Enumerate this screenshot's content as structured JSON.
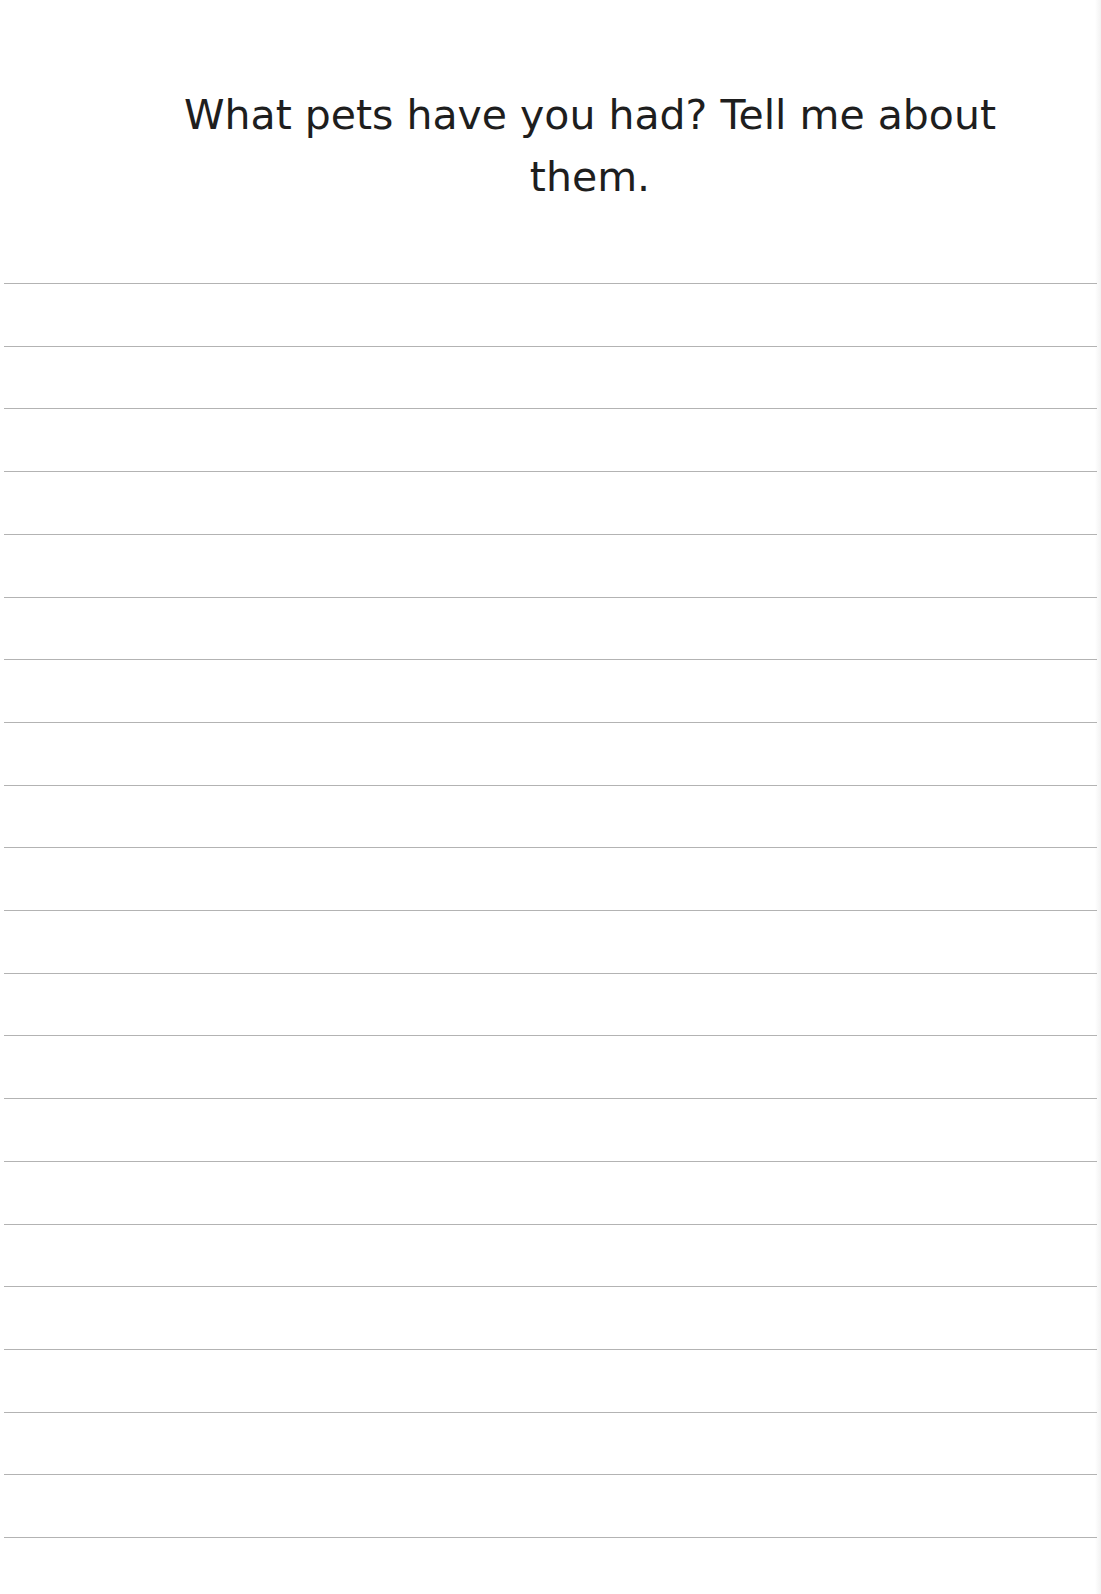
{
  "prompt": {
    "text": "What pets have you had? Tell me about them."
  },
  "writing_area": {
    "line_count": 21,
    "first_line_y": 283,
    "line_spacing": 62.7,
    "line_color": "#9a9a9a"
  }
}
